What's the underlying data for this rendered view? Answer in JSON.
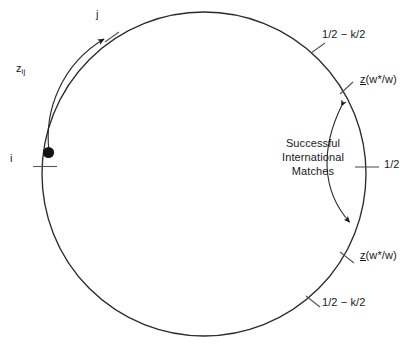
{
  "diagram": {
    "type": "unit-circle-matching-diagram",
    "background_color": "#ffffff",
    "stroke_color": "#1a1a1a",
    "circle": {
      "cx": 204,
      "cy": 174,
      "r": 162
    },
    "point_i": {
      "label": "i",
      "filled": true,
      "x": 47,
      "y": 152
    },
    "point_j": {
      "label": "j"
    },
    "arc_arrow_label": "z",
    "arc_arrow_subscript": "ij",
    "labels": {
      "j": "j",
      "i": "i",
      "z_ij_base": "z",
      "z_ij_sub": "ij",
      "half_minus_k_half_top": "1/2 − k/2",
      "half_minus_k_half_bottom": "1/2 − k/2",
      "z_lower_bound_base": "z",
      "z_lower_bound_arg": "(w*/w)",
      "half": "1/2",
      "successful_line1": "Successful",
      "successful_line2": "International",
      "successful_line3": "Matches"
    },
    "tick_marks": [
      {
        "name": "tick-left-half",
        "angle_deg": 184
      },
      {
        "name": "tick-j",
        "angle_deg": 117
      },
      {
        "name": "tick-half-minus-k-top",
        "angle_deg": 59
      },
      {
        "name": "tick-z-lower-top",
        "angle_deg": 32
      },
      {
        "name": "tick-half-right",
        "angle_deg": 2
      },
      {
        "name": "tick-z-lower-bottom",
        "angle_deg": -28
      },
      {
        "name": "tick-half-minus-k-bottom",
        "angle_deg": -56
      }
    ],
    "annotation_arrow": {
      "name": "successful-international-matches-range",
      "double_headed": true,
      "from_angle_deg": 30,
      "to_angle_deg": -26
    }
  }
}
